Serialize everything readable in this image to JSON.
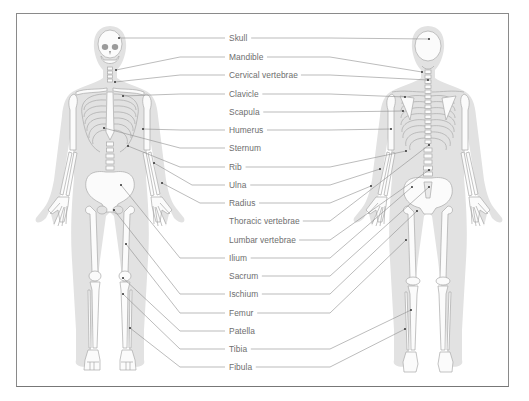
{
  "diagram": {
    "colors": {
      "frame": "#8a8a8a",
      "body_silhouette": "#e2e2e2",
      "bone_fill": "#fbfbfb",
      "bone_stroke": "#a9a9a9",
      "leader_line": "#8f8f8f",
      "label_text": "#6e6e6e",
      "dot": "#333333"
    },
    "views": [
      {
        "name": "front",
        "label": "Anterior view"
      },
      {
        "name": "back",
        "label": "Posterior view"
      }
    ],
    "labels": [
      {
        "text": "Skull",
        "y": 38,
        "left_line": true,
        "right_line": true,
        "front_pt": [
          119,
          38
        ],
        "back_pt": [
          429,
          39
        ]
      },
      {
        "text": "Mandible",
        "y": 57,
        "left_line": true,
        "right_line": true,
        "front_pt": [
          116,
          70
        ],
        "back_pt": [
          422,
          72
        ]
      },
      {
        "text": "Cervical vertebrae",
        "y": 75,
        "left_line": true,
        "right_line": true,
        "front_pt": [
          115,
          82
        ],
        "back_pt": [
          428,
          80
        ]
      },
      {
        "text": "Clavicle",
        "y": 94,
        "left_line": true,
        "right_line": true,
        "front_pt": [
          123,
          96
        ],
        "back_pt": [
          405,
          97
        ]
      },
      {
        "text": "Scapula",
        "y": 112,
        "left_line": false,
        "right_line": true,
        "front_pt": null,
        "back_pt": [
          403,
          111
        ]
      },
      {
        "text": "Humerus",
        "y": 130,
        "left_line": true,
        "right_line": true,
        "front_pt": [
          143,
          129
        ],
        "back_pt": [
          391,
          129
        ]
      },
      {
        "text": "Sternum",
        "y": 148,
        "left_line": true,
        "right_line": false,
        "front_pt": [
          104,
          128
        ],
        "back_pt": null
      },
      {
        "text": "Rib",
        "y": 167,
        "left_line": true,
        "right_line": true,
        "front_pt": [
          128,
          146
        ],
        "back_pt": [
          406,
          151
        ]
      },
      {
        "text": "Ulna",
        "y": 185,
        "left_line": true,
        "right_line": true,
        "front_pt": [
          154,
          163
        ],
        "back_pt": [
          380,
          169
        ]
      },
      {
        "text": "Radius",
        "y": 203,
        "left_line": true,
        "right_line": true,
        "front_pt": [
          162,
          183
        ],
        "back_pt": [
          371,
          186
        ]
      },
      {
        "text": "Thoracic vertebrae",
        "y": 221,
        "left_line": false,
        "right_line": true,
        "front_pt": null,
        "back_pt": [
          429,
          145
        ]
      },
      {
        "text": "Lumbar vertebrae",
        "y": 240,
        "left_line": false,
        "right_line": true,
        "front_pt": null,
        "back_pt": [
          429,
          170
        ]
      },
      {
        "text": "Ilium",
        "y": 258,
        "left_line": true,
        "right_line": true,
        "front_pt": [
          121,
          185
        ],
        "back_pt": [
          412,
          187
        ]
      },
      {
        "text": "Sacrum",
        "y": 276,
        "left_line": false,
        "right_line": true,
        "front_pt": null,
        "back_pt": [
          429,
          187
        ]
      },
      {
        "text": "Ischium",
        "y": 294,
        "left_line": true,
        "right_line": true,
        "front_pt": [
          114,
          210
        ],
        "back_pt": [
          417,
          211
        ]
      },
      {
        "text": "Femur",
        "y": 313,
        "left_line": true,
        "right_line": true,
        "front_pt": [
          126,
          244
        ],
        "back_pt": [
          406,
          240
        ]
      },
      {
        "text": "Patella",
        "y": 331,
        "left_line": true,
        "right_line": false,
        "front_pt": [
          123,
          278
        ],
        "back_pt": null
      },
      {
        "text": "Tibia",
        "y": 349,
        "left_line": true,
        "right_line": true,
        "front_pt": [
          123,
          294
        ],
        "back_pt": [
          411,
          310
        ]
      },
      {
        "text": "Fibula",
        "y": 367,
        "left_line": true,
        "right_line": true,
        "front_pt": [
          130,
          328
        ],
        "back_pt": [
          405,
          329
        ]
      }
    ]
  }
}
